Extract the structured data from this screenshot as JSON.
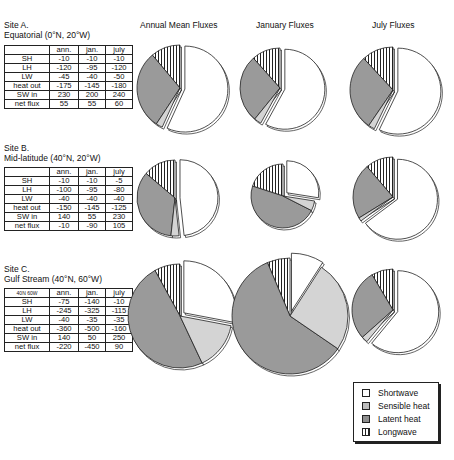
{
  "column_titles": [
    "Annual Mean Fluxes",
    "January Fluxes",
    "July Fluxes"
  ],
  "sites": [
    {
      "name": "Site A.",
      "subtitle": "Equatorial (0°N, 20°W)",
      "corner": "",
      "headers": [
        "ann.",
        "jan.",
        "july"
      ],
      "rows": [
        {
          "label": "SH",
          "values": [
            "-10",
            "-10",
            "-10"
          ]
        },
        {
          "label": "LH",
          "values": [
            "-120",
            "-95",
            "-120"
          ]
        },
        {
          "label": "LW",
          "values": [
            "-45",
            "-40",
            "-50"
          ]
        },
        {
          "label": "heat out",
          "values": [
            "-175",
            "-145",
            "-180"
          ]
        },
        {
          "label": "SW in",
          "values": [
            "230",
            "200",
            "240"
          ]
        },
        {
          "label": "net flux",
          "values": [
            "55",
            "55",
            "60"
          ]
        }
      ]
    },
    {
      "name": "Site B.",
      "subtitle": "Mid-latitude (40°N, 20°W)",
      "corner": "",
      "headers": [
        "ann.",
        "jan.",
        "july"
      ],
      "rows": [
        {
          "label": "SH",
          "values": [
            "-10",
            "-10",
            "-5"
          ]
        },
        {
          "label": "LH",
          "values": [
            "-100",
            "-95",
            "-80"
          ]
        },
        {
          "label": "LW",
          "values": [
            "-40",
            "-40",
            "-40"
          ]
        },
        {
          "label": "heat out",
          "values": [
            "-150",
            "-145",
            "-125"
          ]
        },
        {
          "label": "SW in",
          "values": [
            "140",
            "55",
            "230"
          ]
        },
        {
          "label": "net flux",
          "values": [
            "-10",
            "-90",
            "105"
          ]
        }
      ]
    },
    {
      "name": "Site C.",
      "subtitle": "Gulf Stream (40°N, 60°W)",
      "corner": "40N 60W",
      "headers": [
        "ann.",
        "jan.",
        "july"
      ],
      "rows": [
        {
          "label": "SH",
          "values": [
            "-75",
            "-140",
            "-10"
          ]
        },
        {
          "label": "LH",
          "values": [
            "-245",
            "-325",
            "-115"
          ]
        },
        {
          "label": "LW",
          "values": [
            "-40",
            "-35",
            "-35"
          ]
        },
        {
          "label": "heat out",
          "values": [
            "-360",
            "-500",
            "-160"
          ]
        },
        {
          "label": "SW in",
          "values": [
            "140",
            "50",
            "250"
          ]
        },
        {
          "label": "net flux",
          "values": [
            "-220",
            "-450",
            "90"
          ]
        }
      ]
    }
  ],
  "legend": {
    "items": [
      {
        "label": "Shortwave",
        "pattern": "white"
      },
      {
        "label": "Sensible heat",
        "pattern": "light-gray"
      },
      {
        "label": "Latent heat",
        "pattern": "dark-gray"
      },
      {
        "label": "Longwave",
        "pattern": "vertical-stripes"
      }
    ]
  },
  "colors": {
    "shortwave": "#ffffff",
    "sensible": "#d4d4d4",
    "latent": "#9a9a9a",
    "longwave_stripe": "#222222",
    "outline": "#222222"
  },
  "chart_data": {
    "type": "pie",
    "categories": [
      "Shortwave",
      "Sensible heat",
      "Latent heat",
      "Longwave"
    ],
    "legend_position": "bottom-right",
    "panels": [
      {
        "site": "Site A. Equatorial (0°N, 20°W)",
        "period": "Annual Mean Fluxes",
        "values": [
          230,
          10,
          120,
          45
        ]
      },
      {
        "site": "Site A. Equatorial (0°N, 20°W)",
        "period": "January Fluxes",
        "values": [
          200,
          10,
          95,
          40
        ]
      },
      {
        "site": "Site A. Equatorial (0°N, 20°W)",
        "period": "July Fluxes",
        "values": [
          240,
          10,
          120,
          50
        ]
      },
      {
        "site": "Site B. Mid-latitude (40°N, 20°W)",
        "period": "Annual Mean Fluxes",
        "values": [
          140,
          10,
          100,
          40
        ]
      },
      {
        "site": "Site B. Mid-latitude (40°N, 20°W)",
        "period": "January Fluxes",
        "values": [
          55,
          10,
          95,
          40
        ]
      },
      {
        "site": "Site B. Mid-latitude (40°N, 20°W)",
        "period": "July Fluxes",
        "values": [
          230,
          5,
          80,
          40
        ]
      },
      {
        "site": "Site C. Gulf Stream (40°N, 60°W)",
        "period": "Annual Mean Fluxes",
        "values": [
          140,
          75,
          245,
          40
        ]
      },
      {
        "site": "Site C. Gulf Stream (40°N, 60°W)",
        "period": "January Fluxes",
        "values": [
          50,
          140,
          325,
          35
        ]
      },
      {
        "site": "Site C. Gulf Stream (40°N, 60°W)",
        "period": "July Fluxes",
        "values": [
          250,
          10,
          115,
          35
        ]
      }
    ]
  }
}
